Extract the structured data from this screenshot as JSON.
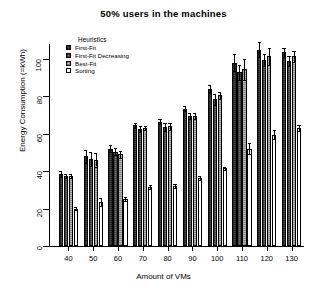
{
  "chart_data": {
    "type": "bar",
    "title": "50% users in the machines",
    "xlabel": "Amount of VMs",
    "ylabel": "Energy Consumption (=kWh)",
    "categories": [
      "40",
      "50",
      "60",
      "70",
      "80",
      "90",
      "100",
      "110",
      "120",
      "130"
    ],
    "yticks": [
      "0",
      "20",
      "40",
      "60",
      "80",
      "100"
    ],
    "ylim": [
      0,
      108
    ],
    "grid": false,
    "legend_title": "Heuristics",
    "legend_position": "top-left inside",
    "series": [
      {
        "name": "First-Fit",
        "color": "#4a4a4a",
        "values": [
          38.5,
          48.0,
          52.0,
          64.5,
          66.5,
          73.5,
          84.0,
          98.0,
          105.0,
          103.5
        ],
        "errors": [
          1.5,
          3.5,
          2.0,
          1.5,
          1.5,
          1.5,
          2.0,
          4.5,
          4.0,
          2.5
        ]
      },
      {
        "name": "First-Fit Decreasing",
        "color": "#6e6e6e",
        "values": [
          37.5,
          46.5,
          50.5,
          62.5,
          63.5,
          69.5,
          78.5,
          93.0,
          99.5,
          99.0
        ],
        "errors": [
          1.0,
          3.5,
          2.0,
          1.5,
          2.0,
          1.5,
          3.0,
          4.0,
          3.0,
          2.5
        ]
      },
      {
        "name": "Best-Fit",
        "color": "#b5b5b5",
        "values": [
          37.5,
          46.0,
          49.0,
          63.0,
          64.0,
          69.5,
          80.5,
          94.5,
          101.5,
          101.5
        ],
        "errors": [
          1.0,
          3.5,
          2.0,
          1.0,
          2.0,
          1.5,
          2.0,
          5.5,
          4.5,
          3.0
        ]
      },
      {
        "name": "Sorting",
        "color": "#ffffff",
        "values": [
          20.0,
          23.5,
          25.0,
          31.5,
          32.0,
          36.5,
          41.5,
          52.0,
          59.5,
          63.0
        ],
        "errors": [
          1.0,
          2.0,
          1.0,
          1.0,
          1.0,
          1.0,
          1.0,
          3.0,
          2.5,
          1.5
        ]
      }
    ]
  }
}
